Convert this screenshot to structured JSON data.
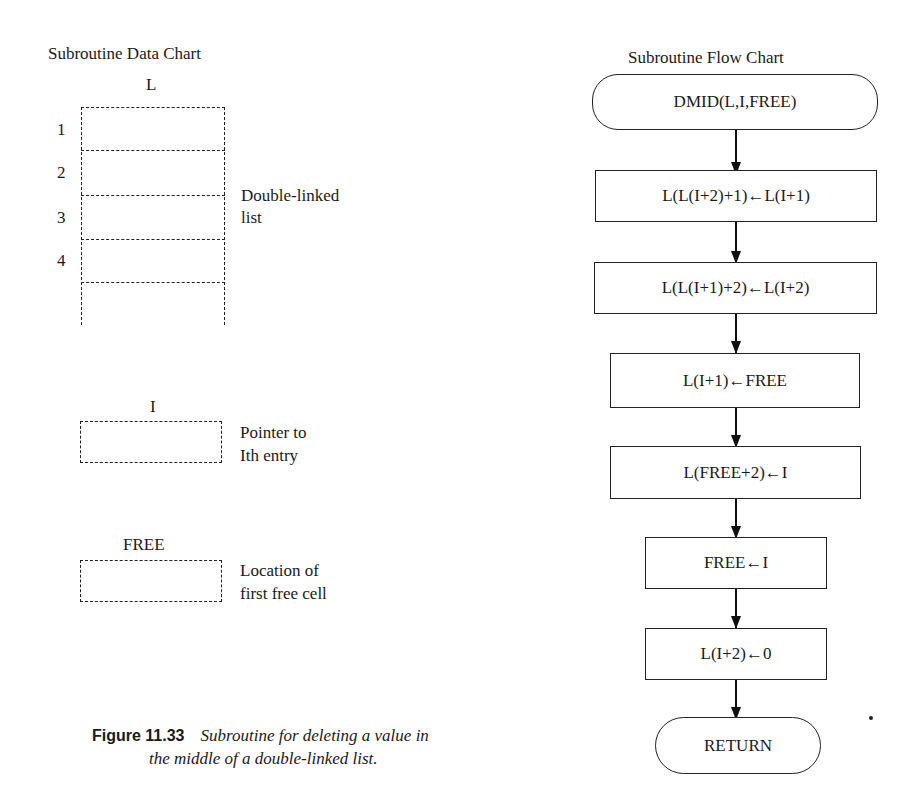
{
  "data_chart": {
    "title": "Subroutine Data Chart",
    "list": {
      "name": "L",
      "row_labels": [
        "1",
        "2",
        "3",
        "4"
      ],
      "description_line1": "Double-linked",
      "description_line2": "list"
    },
    "pointer": {
      "name": "I",
      "description_line1": "Pointer to",
      "description_line2": "Ith entry"
    },
    "free": {
      "name": "FREE",
      "description_line1": "Location of",
      "description_line2": "first free cell"
    }
  },
  "flow_chart": {
    "title": "Subroutine Flow Chart",
    "start": "DMID(L,I,FREE)",
    "steps": [
      "L(L(I+2)+1)←L(I+1)",
      "L(L(I+1)+2)←L(I+2)",
      "L(I+1)←FREE",
      "L(FREE+2)←I",
      "FREE←I",
      "L(I+2)←0"
    ],
    "end": "RETURN"
  },
  "caption": {
    "figure_label": "Figure 11.33",
    "text_line1": "Subroutine for deleting a value in",
    "text_line2": "the middle of a double-linked list."
  }
}
